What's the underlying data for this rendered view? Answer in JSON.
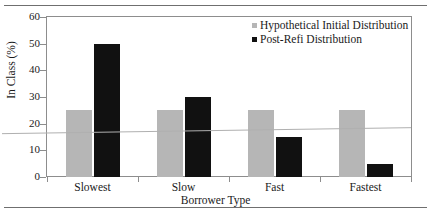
{
  "chart_data": {
    "type": "bar",
    "title": "",
    "subtitle": "",
    "xlabel": "Borrower Type",
    "ylabel": "In Class (%)",
    "categories": [
      "Slowest",
      "Slow",
      "Fast",
      "Fastest"
    ],
    "series": [
      {
        "name": "Hypothetical Initial Distribution",
        "color": "#b6b6b6",
        "values": [
          25,
          25,
          25,
          25
        ]
      },
      {
        "name": "Post-Refi Distribution",
        "color": "#111111",
        "values": [
          50,
          30,
          15,
          5
        ]
      }
    ],
    "trend_line": {
      "name": "trend",
      "color": "#b0b0b0",
      "y_start": 16.5,
      "y_end": 18.5
    },
    "ylim": [
      0,
      60
    ],
    "yticks": [
      0,
      10,
      20,
      30,
      40,
      50,
      60
    ],
    "ytick_labels": [
      "0",
      "10",
      "20",
      "30",
      "40",
      "50",
      "60"
    ],
    "grid": false,
    "legend_position": "top-right"
  },
  "axes": {
    "y_title": "In Class (%)",
    "x_title": "Borrower Type"
  },
  "legend": {
    "items": [
      {
        "label": "Hypothetical Initial Distribution",
        "color": "#b6b6b6"
      },
      {
        "label": "Post-Refi Distribution",
        "color": "#111111"
      }
    ]
  }
}
